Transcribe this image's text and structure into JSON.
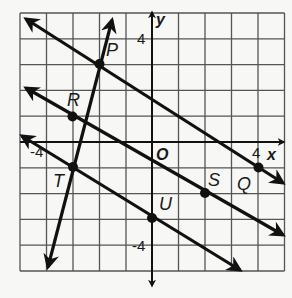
{
  "graph": {
    "axes": {
      "x_label": "x",
      "y_label": "y",
      "origin_label": "O"
    },
    "ticks": {
      "x_pos": "4",
      "x_neg": "-4",
      "y_pos": "4",
      "y_neg": "-4"
    },
    "points": [
      {
        "name": "P",
        "x": -2,
        "y": 3
      },
      {
        "name": "Q",
        "x": 4,
        "y": -1
      },
      {
        "name": "R",
        "x": -3,
        "y": 1
      },
      {
        "name": "S",
        "x": 1.5,
        "y": -2
      },
      {
        "name": "T",
        "x": -3,
        "y": -1
      },
      {
        "name": "U",
        "x": 0,
        "y": -3
      }
    ],
    "lines": [
      {
        "name": "line-PQ",
        "slope": "-2/3"
      },
      {
        "name": "line-RS",
        "slope": "-2/3"
      },
      {
        "name": "line-TU",
        "slope": "-2/3"
      },
      {
        "name": "line-PT",
        "slope": "4"
      }
    ],
    "colors": {
      "ink": "#111111",
      "grid": "#555555",
      "background": "#f7f7f5"
    }
  },
  "labels": {
    "P": "P",
    "Q": "Q",
    "R": "R",
    "S": "S",
    "T": "T",
    "U": "U"
  }
}
